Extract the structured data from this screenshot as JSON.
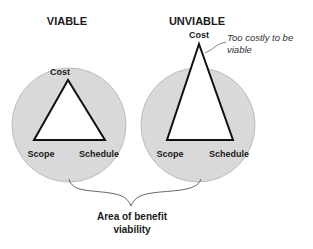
{
  "colors": {
    "circle_fill": "#d9d9d9",
    "circle_stroke": "#bdbdbd",
    "triangle_fill": "#ffffff",
    "triangle_stroke": "#111111",
    "text": "#1a1a1a",
    "brace": "#555555"
  },
  "viable": {
    "title": "VIABLE",
    "vertex_top": "Cost",
    "vertex_left": "Scope",
    "vertex_right": "Schedule"
  },
  "unviable": {
    "title": "UNVIABLE",
    "vertex_top": "Cost",
    "vertex_left": "Scope",
    "vertex_right": "Schedule",
    "annotation_line1": "Too costly to be",
    "annotation_line2": "viable"
  },
  "footer": {
    "line1": "Area of benefit",
    "line2": "viability"
  }
}
